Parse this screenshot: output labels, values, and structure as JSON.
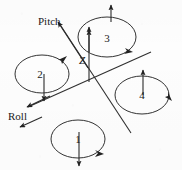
{
  "figure": {
    "background_color": "#fdfdfd",
    "line_color": "#2b2b2b",
    "text_color": "#1a1a1a"
  },
  "axes": {
    "pitch": {
      "label": "Pitch"
    },
    "roll": {
      "label": "Roll"
    },
    "z": {
      "label": "Z"
    }
  },
  "rotors": [
    {
      "label": "1",
      "position": "bottom",
      "thrust": "down",
      "spin": "clockwise"
    },
    {
      "label": "2",
      "position": "left",
      "thrust": "down",
      "spin": "clockwise"
    },
    {
      "label": "3",
      "position": "top",
      "thrust": "up",
      "spin": "clockwise"
    },
    {
      "label": "4",
      "position": "right",
      "thrust": "up",
      "spin": "clockwise"
    }
  ]
}
